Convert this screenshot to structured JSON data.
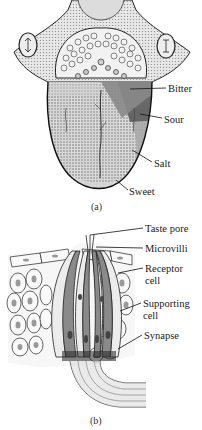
{
  "figure_a": {
    "caption": "(a)",
    "subject": "tongue taste regions",
    "labels": [
      {
        "text": "Bitter",
        "x": 168,
        "y": 83
      },
      {
        "text": "Sour",
        "x": 164,
        "y": 114
      },
      {
        "text": "Salt",
        "x": 154,
        "y": 158
      },
      {
        "text": "Sweet",
        "x": 129,
        "y": 186
      }
    ],
    "region_colors": {
      "bitter": "#8a8a8a",
      "sour": "#5e5e5e",
      "salt": "#a9a9a9",
      "sweet": "#d0d0d0",
      "base": "#c4c4c4"
    }
  },
  "figure_b": {
    "caption": "(b)",
    "subject": "taste bud cross-section",
    "labels": [
      {
        "text": "Taste pore",
        "x": 145,
        "y": 8
      },
      {
        "text": "Microvilli",
        "x": 145,
        "y": 28
      },
      {
        "text": "Receptor",
        "x": 145,
        "y": 48
      },
      {
        "text": "cell",
        "x": 145,
        "y": 60
      },
      {
        "text": "Supporting",
        "x": 143,
        "y": 83
      },
      {
        "text": "cell",
        "x": 143,
        "y": 95
      },
      {
        "text": "Synapse",
        "x": 144,
        "y": 115
      }
    ]
  }
}
